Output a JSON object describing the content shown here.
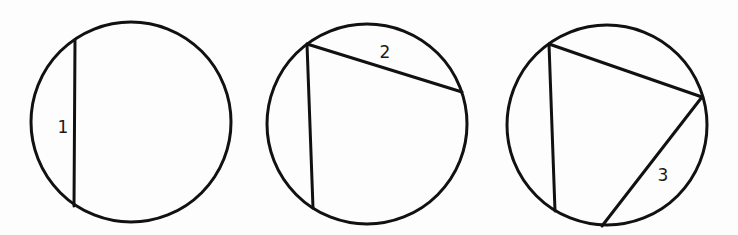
{
  "diagram": {
    "title": "",
    "stroke_color": "#111111",
    "background": "#fdfdfd",
    "panels": [
      {
        "id": "panel-1",
        "circle": {
          "cx": 131,
          "cy": 122,
          "r": 100
        },
        "chords": [
          {
            "id": "chord-1",
            "x1": 75,
            "y1": 40,
            "x2": 74,
            "y2": 206
          }
        ],
        "label": {
          "text": "1",
          "x": 63,
          "y": 127
        }
      },
      {
        "id": "panel-2",
        "circle": {
          "cx": 367,
          "cy": 124,
          "r": 100
        },
        "chords": [
          {
            "id": "chord-1",
            "x1": 307,
            "y1": 44,
            "x2": 313,
            "y2": 208
          },
          {
            "id": "chord-2",
            "x1": 307,
            "y1": 44,
            "x2": 462,
            "y2": 92
          }
        ],
        "label": {
          "text": "2",
          "x": 385,
          "y": 52
        }
      },
      {
        "id": "panel-3",
        "circle": {
          "cx": 607,
          "cy": 125,
          "r": 100
        },
        "chords": [
          {
            "id": "chord-1",
            "x1": 549,
            "y1": 44,
            "x2": 555,
            "y2": 211
          },
          {
            "id": "chord-2",
            "x1": 549,
            "y1": 44,
            "x2": 702,
            "y2": 97
          },
          {
            "id": "chord-3",
            "x1": 702,
            "y1": 97,
            "x2": 602,
            "y2": 226
          }
        ],
        "label": {
          "text": "3",
          "x": 663,
          "y": 175
        }
      }
    ]
  }
}
